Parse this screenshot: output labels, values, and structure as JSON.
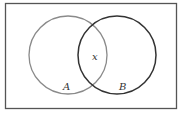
{
  "diagram": {
    "type": "venn",
    "universe": {
      "x": 5,
      "y": 3,
      "width": 171,
      "height": 105,
      "stroke": "#555555"
    },
    "sets": [
      {
        "label": "A",
        "cx": 68,
        "cy": 55,
        "r": 39,
        "stroke": "#8a8a8a",
        "label_x": 63,
        "label_y": 90
      },
      {
        "label": "B",
        "cx": 117,
        "cy": 55,
        "r": 39,
        "stroke": "#333333",
        "label_x": 119,
        "label_y": 90
      }
    ],
    "intersection_label": {
      "text": "x",
      "x": 92,
      "y": 60
    }
  }
}
